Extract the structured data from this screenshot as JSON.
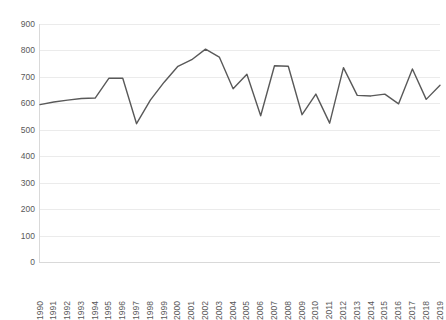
{
  "chart_data": {
    "type": "line",
    "title": "",
    "subtitle": "",
    "xlabel": "",
    "ylabel": "",
    "categories": [
      "1990",
      "1991",
      "1992",
      "1993",
      "1994",
      "1995",
      "1996",
      "1997",
      "1998",
      "1999",
      "2000",
      "2001",
      "2002",
      "2003",
      "2004",
      "2005",
      "2006",
      "2007",
      "2008",
      "2009",
      "2010",
      "2011",
      "2012",
      "2013",
      "2014",
      "2015",
      "2016",
      "2017",
      "2018",
      "2019"
    ],
    "values": [
      595,
      605,
      612,
      618,
      620,
      695,
      695,
      523,
      612,
      680,
      740,
      765,
      805,
      775,
      655,
      710,
      553,
      742,
      740,
      557,
      635,
      525,
      735,
      630,
      628,
      635,
      598,
      730,
      615,
      668
    ],
    "series": [
      {
        "name": "",
        "values": [
          595,
          605,
          612,
          618,
          620,
          695,
          695,
          523,
          612,
          680,
          740,
          765,
          805,
          775,
          655,
          710,
          553,
          742,
          740,
          557,
          635,
          525,
          735,
          630,
          628,
          635,
          598,
          730,
          615,
          668
        ]
      }
    ],
    "ylim": [
      0,
      900
    ],
    "y_ticks": [
      0,
      100,
      200,
      300,
      400,
      500,
      600,
      700,
      800,
      900
    ],
    "y_tick_labels": [
      "0",
      "100",
      "200",
      "300",
      "400",
      "500",
      "600",
      "700",
      "800",
      "900"
    ],
    "grid": "horizontal",
    "legend": "none",
    "line_color": "#595959",
    "grid_color": "#ebebeb",
    "axis_color": "#d9d9d9",
    "tick_label_color": "#595959",
    "background_color": "#ffffff",
    "markers": false,
    "line_width": 1.4,
    "x_tick_rotation": -90
  }
}
